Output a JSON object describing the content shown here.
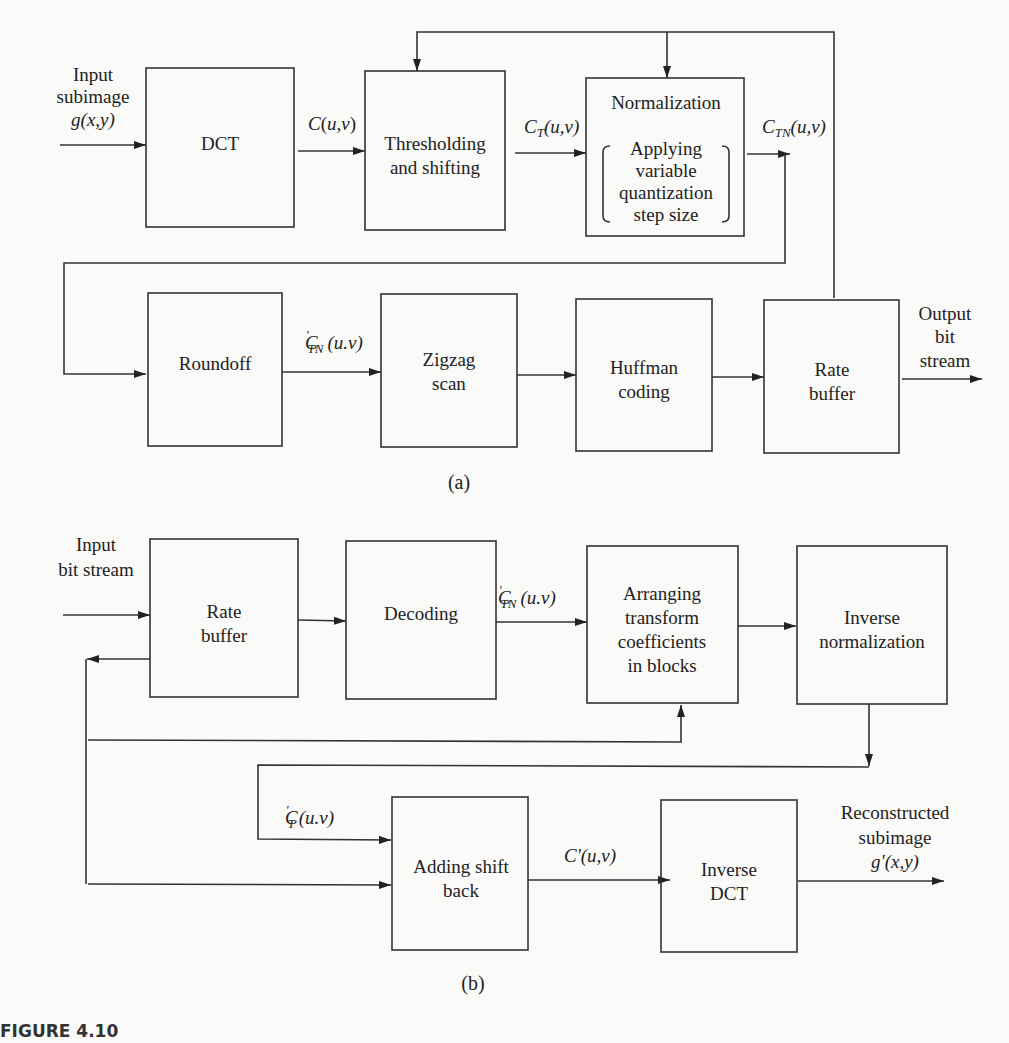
{
  "figure_label": "FIGURE 4.10",
  "encoder": {
    "caption": "(a)",
    "input_label": [
      "Input",
      "subimage",
      "g(x,y)"
    ],
    "output_label": [
      "Output",
      "bit",
      "stream"
    ],
    "blocks": [
      {
        "id": "dct",
        "lines": [
          "DCT"
        ]
      },
      {
        "id": "threshold",
        "lines": [
          "Thresholding",
          "and shifting"
        ]
      },
      {
        "id": "normalization",
        "title": "Normalization",
        "lines": [
          "Applying",
          "variable",
          "quantization",
          "step size"
        ]
      },
      {
        "id": "roundoff",
        "lines": [
          "Roundoff"
        ]
      },
      {
        "id": "zigzag",
        "lines": [
          "Zigzag",
          "scan"
        ]
      },
      {
        "id": "huffman",
        "lines": [
          "Huffman",
          "coding"
        ]
      },
      {
        "id": "rate_buffer",
        "lines": [
          "Rate",
          "buffer"
        ]
      }
    ],
    "signals": {
      "c": {
        "main": "C",
        "sub": "",
        "arg": "(u,v)"
      },
      "ct": {
        "main": "C",
        "sub": "T",
        "arg": "(u,v)"
      },
      "ctn": {
        "main": "C",
        "sub": "TN",
        "arg": "(u,v)"
      },
      "ctn_prime": {
        "main": "C",
        "prime": "'",
        "sub": "TN",
        "arg": "(u.v)"
      }
    }
  },
  "decoder": {
    "caption": "(b)",
    "input_label": [
      "Input",
      "bit stream"
    ],
    "output_label": [
      "Reconstructed",
      "subimage",
      "g'(x,y)"
    ],
    "blocks": [
      {
        "id": "rate_buffer",
        "lines": [
          "Rate",
          "buffer"
        ]
      },
      {
        "id": "decoding",
        "lines": [
          "Decoding"
        ]
      },
      {
        "id": "arranging",
        "lines": [
          "Arranging",
          "transform",
          "coefficients",
          "in blocks"
        ]
      },
      {
        "id": "inverse_norm",
        "lines": [
          "Inverse",
          "normalization"
        ]
      },
      {
        "id": "adding_shift",
        "lines": [
          "Adding shift",
          "back"
        ]
      },
      {
        "id": "inverse_dct",
        "lines": [
          "Inverse",
          "DCT"
        ]
      }
    ],
    "signals": {
      "ctn_prime": {
        "main": "C",
        "prime": "'",
        "sub": "TN",
        "arg": "(u.v)"
      },
      "ct_prime": {
        "main": "C",
        "prime": "'",
        "sub": "T",
        "arg": "(u.v)"
      },
      "c_prime": {
        "main": "C'",
        "sub": "",
        "arg": "(u,v)"
      }
    }
  }
}
